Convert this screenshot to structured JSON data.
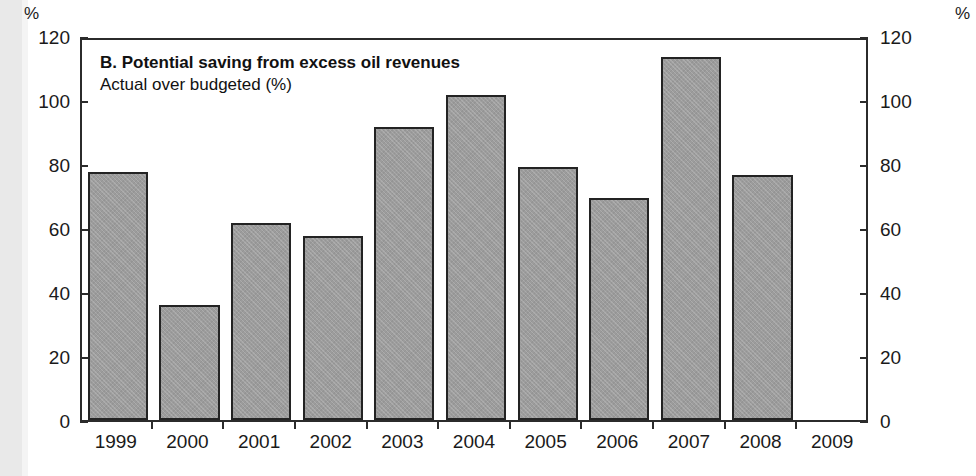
{
  "chart_data": {
    "type": "bar",
    "title": "B. Potential saving from excess oil revenues",
    "subtitle": "Actual over budgeted (%)",
    "xlabel": "",
    "ylabel": "%",
    "y_unit_label_left": "%",
    "y_unit_label_right": "%",
    "categories": [
      "1999",
      "2000",
      "2001",
      "2002",
      "2003",
      "2004",
      "2005",
      "2006",
      "2007",
      "2008",
      "2009"
    ],
    "values": [
      77.5,
      36,
      61.5,
      57.5,
      91.5,
      101.5,
      79,
      69.5,
      113.5,
      76.5,
      null
    ],
    "ylim": [
      0,
      120
    ],
    "yticks": [
      0,
      20,
      40,
      60,
      80,
      100,
      120
    ],
    "ytick_labels_left": [
      "0",
      "20",
      "40",
      "60",
      "80",
      "100",
      "120"
    ],
    "ytick_labels_right": [
      "0",
      "20",
      "40",
      "60",
      "80",
      "100",
      "120"
    ],
    "grid": false,
    "legend": null,
    "bar_color": "#9c9c9c",
    "bar_edge_color": "#232323",
    "axis_color": "#2b2b2b",
    "background_color": "#ffffff"
  }
}
